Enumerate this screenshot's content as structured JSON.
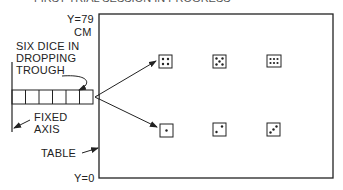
{
  "header": {
    "partial_title": "FIRST TRIAL SESSION IN PROGRESS"
  },
  "labels": {
    "y_top": "Y=79",
    "y_unit": "CM",
    "trough_line1": "SIX DICE IN",
    "trough_line2": "DROPPING",
    "trough_line3": "TROUGH",
    "axis_line1": "FIXED",
    "axis_line2": "AXIS",
    "table": "TABLE",
    "y_bottom": "Y=0"
  },
  "dice_top_row": [
    4,
    5,
    6
  ],
  "dice_bottom_row": [
    1,
    2,
    3
  ],
  "colors": {
    "ink": "#222222",
    "background": "#ffffff"
  }
}
